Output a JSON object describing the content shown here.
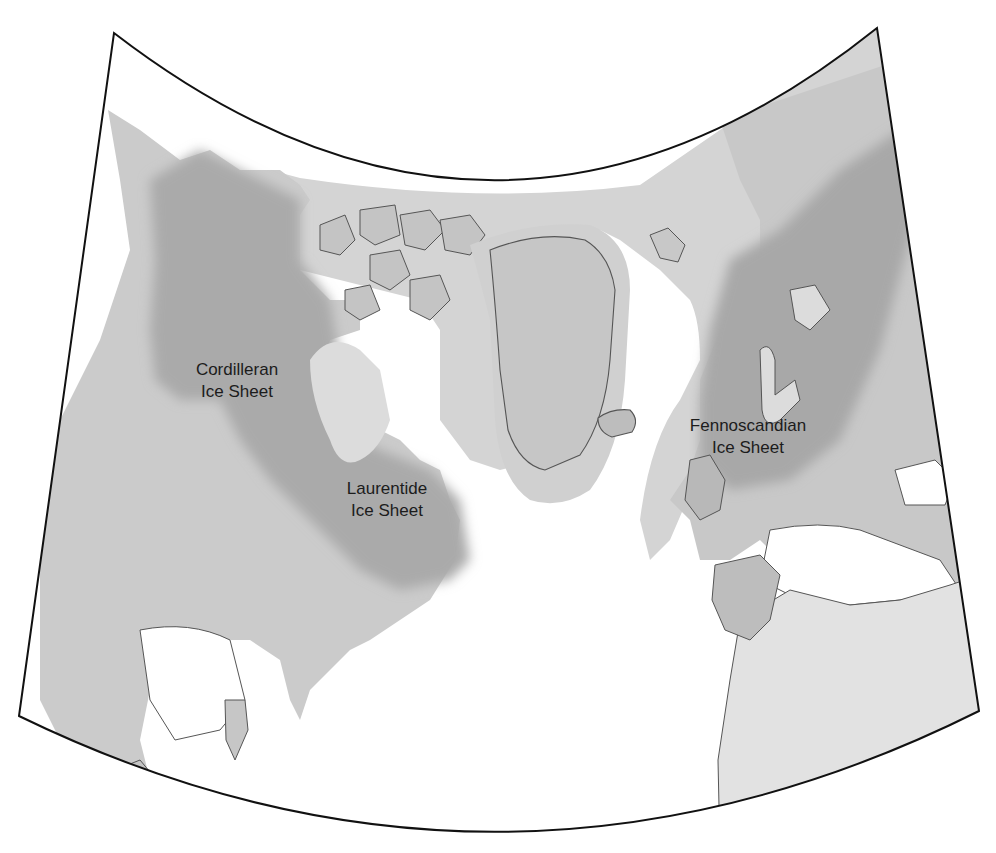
{
  "map": {
    "title": "",
    "projection": "conic",
    "style": "grayscale shaded relief",
    "colors": {
      "ocean": "#ffffff",
      "land": "#c9c9c9",
      "land_light": "#d9d9d9",
      "ice_extent": "#cfcfcf",
      "ice_core": "#a9a9a9",
      "sea_ice": "#d6d6d6",
      "coastline": "#555555",
      "frame": "#111111",
      "label_text": "#1c1c1c"
    },
    "labels": [
      {
        "id": "cordilleran",
        "line1": "Cordilleran",
        "line2": "Ice Sheet"
      },
      {
        "id": "laurentide",
        "line1": "Laurentide",
        "line2": "Ice Sheet"
      },
      {
        "id": "fennoscandian",
        "line1": "Fennoscandian",
        "line2": "Ice Sheet"
      }
    ],
    "regions_shown": [
      "North America",
      "Greenland",
      "Iceland",
      "Arctic Archipelago",
      "Svalbard",
      "Scandinavia",
      "British Isles",
      "Europe",
      "North Africa",
      "Caribbean",
      "Atlantic Ocean"
    ]
  }
}
